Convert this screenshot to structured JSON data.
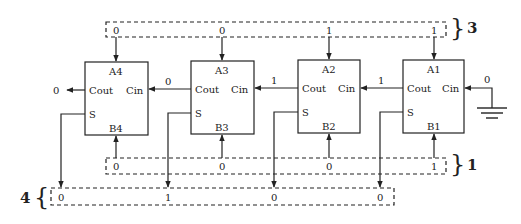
{
  "diagram": {
    "adders": [
      {
        "id": "A4",
        "a_label": "A4",
        "b_label": "B4",
        "cout_label": "Cout",
        "cin_label": "Cin",
        "s_label": "S",
        "a_in": "0",
        "b_in": "0",
        "carry_out": "0",
        "sum_out": "0"
      },
      {
        "id": "A3",
        "a_label": "A3",
        "b_label": "B3",
        "cout_label": "Cout",
        "cin_label": "Cin",
        "s_label": "S",
        "a_in": "0",
        "b_in": "0",
        "carry_out": "0",
        "sum_out": "1"
      },
      {
        "id": "A2",
        "a_label": "A2",
        "b_label": "B2",
        "cout_label": "Cout",
        "cin_label": "Cin",
        "s_label": "S",
        "a_in": "1",
        "b_in": "0",
        "carry_out": "1",
        "sum_out": "0"
      },
      {
        "id": "A1",
        "a_label": "A1",
        "b_label": "B1",
        "cout_label": "Cout",
        "cin_label": "Cin",
        "s_label": "S",
        "a_in": "1",
        "b_in": "1",
        "carry_out": "1",
        "sum_out": "0"
      }
    ],
    "carry_in_initial": "0",
    "final_carry_out": "0",
    "groups": {
      "a_group": {
        "label": "3"
      },
      "b_group": {
        "label": "1"
      },
      "sum_group": {
        "label": "4"
      }
    },
    "colors": {
      "line": "#222222",
      "background": "#ffffff"
    }
  }
}
